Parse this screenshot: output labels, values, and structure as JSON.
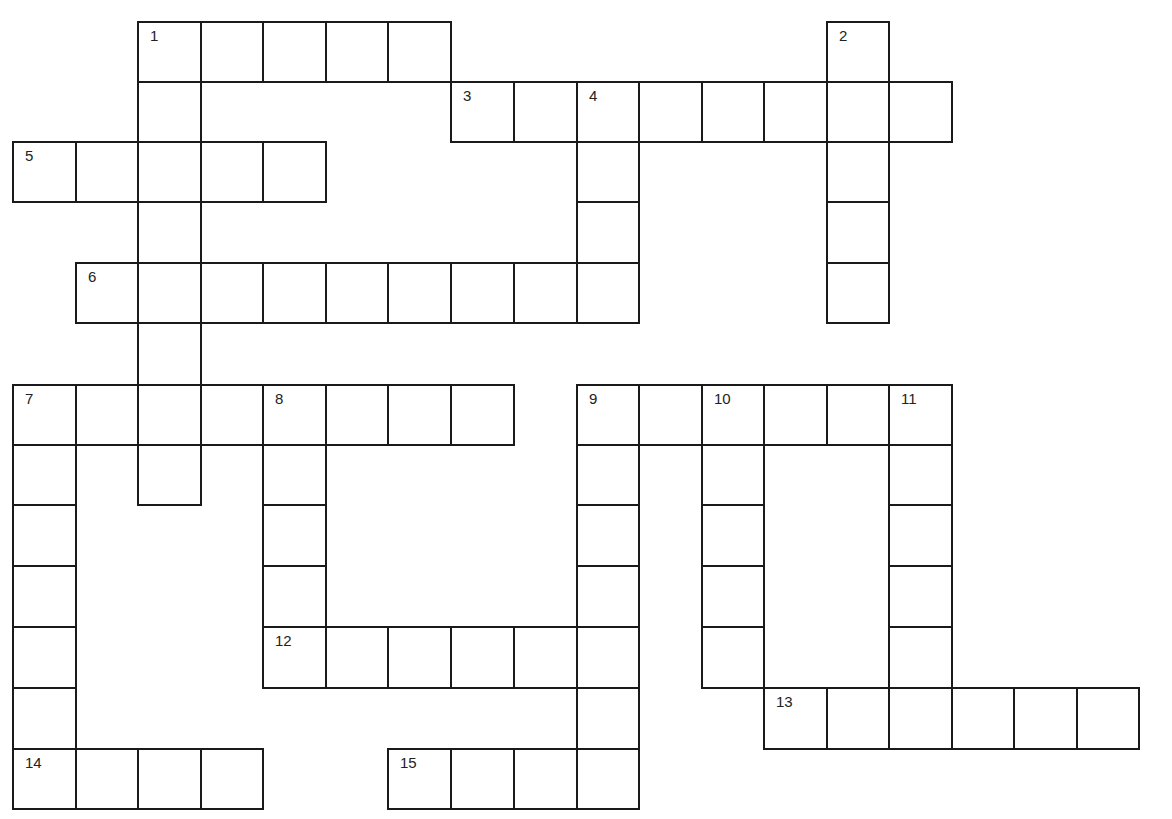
{
  "puzzle": {
    "col_x": [
      13,
      76,
      138,
      201,
      263,
      326,
      388,
      451,
      514,
      577,
      639,
      702,
      764,
      827,
      889,
      952,
      1014,
      1077,
      1139
    ],
    "row_y": [
      22,
      82,
      142,
      202,
      263,
      323,
      385,
      445,
      505,
      566,
      627,
      688,
      749,
      809
    ],
    "line_color": "#1a1a1a",
    "background": "#ffffff",
    "entries": [
      {
        "number": "1",
        "direction": "across",
        "row": 0,
        "col": 2,
        "length": 5
      },
      {
        "number": "1",
        "direction": "down",
        "row": 0,
        "col": 2,
        "length": 8
      },
      {
        "number": "2",
        "direction": "down",
        "row": 0,
        "col": 13,
        "length": 5
      },
      {
        "number": "3",
        "direction": "across",
        "row": 1,
        "col": 7,
        "length": 8
      },
      {
        "number": "4",
        "direction": "down",
        "row": 1,
        "col": 9,
        "length": 4
      },
      {
        "number": "5",
        "direction": "across",
        "row": 2,
        "col": 0,
        "length": 5
      },
      {
        "number": "6",
        "direction": "across",
        "row": 4,
        "col": 1,
        "length": 9
      },
      {
        "number": "7",
        "direction": "across",
        "row": 6,
        "col": 0,
        "length": 8
      },
      {
        "number": "7",
        "direction": "down",
        "row": 6,
        "col": 0,
        "length": 7
      },
      {
        "number": "8",
        "direction": "down",
        "row": 6,
        "col": 4,
        "length": 5
      },
      {
        "number": "9",
        "direction": "across",
        "row": 6,
        "col": 9,
        "length": 6
      },
      {
        "number": "9",
        "direction": "down",
        "row": 6,
        "col": 9,
        "length": 7
      },
      {
        "number": "10",
        "direction": "down",
        "row": 6,
        "col": 11,
        "length": 5
      },
      {
        "number": "11",
        "direction": "down",
        "row": 6,
        "col": 14,
        "length": 5
      },
      {
        "number": "12",
        "direction": "across",
        "row": 10,
        "col": 4,
        "length": 6
      },
      {
        "number": "13",
        "direction": "across",
        "row": 11,
        "col": 12,
        "length": 6
      },
      {
        "number": "14",
        "direction": "across",
        "row": 12,
        "col": 0,
        "length": 4
      },
      {
        "number": "15",
        "direction": "across",
        "row": 12,
        "col": 6,
        "length": 4
      }
    ]
  }
}
